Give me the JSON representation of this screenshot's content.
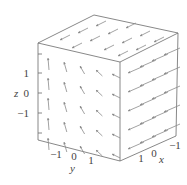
{
  "chart_data": {
    "type": "vector_field_3d",
    "title": "",
    "axes": {
      "x": {
        "label": "x",
        "ticks": [
          "-1",
          "0",
          "1"
        ],
        "range": [
          -1.5,
          1.5
        ]
      },
      "y": {
        "label": "y",
        "ticks": [
          "-1",
          "0",
          "1"
        ],
        "range": [
          -1.5,
          1.5
        ]
      },
      "z": {
        "label": "z",
        "ticks": [
          "1",
          "0",
          "-1"
        ],
        "range": [
          -1.5,
          1.5
        ]
      }
    },
    "box": true,
    "grid": false,
    "legend": null
  },
  "labels": {
    "z_axis": "z",
    "y_axis": "y",
    "x_axis": "x",
    "z_ticks": [
      "1",
      "0",
      "−1"
    ],
    "y_ticks": [
      "−1",
      "0",
      "1"
    ],
    "x_ticks": [
      "1",
      "0",
      "−1"
    ]
  }
}
